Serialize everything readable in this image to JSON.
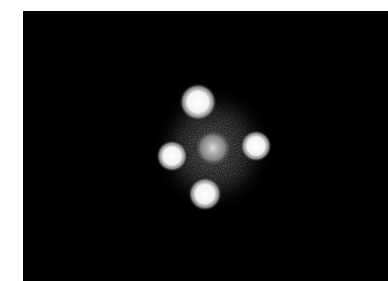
{
  "image": {
    "subject": "quadruply lensed quasar (cross-shaped arrangement of four bright point sources around a central diffuse glow)",
    "background_color": "#000000",
    "page_color": "#ffffff",
    "sources": [
      {
        "name": "top",
        "cx": 175,
        "cy": 91,
        "r": 15
      },
      {
        "name": "left",
        "cx": 149,
        "cy": 145,
        "r": 12
      },
      {
        "name": "right",
        "cx": 233,
        "cy": 135,
        "r": 12
      },
      {
        "name": "bottom",
        "cx": 182,
        "cy": 183,
        "r": 13
      },
      {
        "name": "center",
        "cx": 190,
        "cy": 137,
        "r": 16
      }
    ]
  }
}
